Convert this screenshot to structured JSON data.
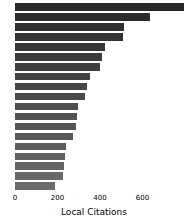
{
  "chart_data": {
    "type": "bar",
    "orientation": "horizontal",
    "title": "",
    "xlabel": "Local Citations",
    "ylabel": "",
    "xlim": [
      0,
      800
    ],
    "ylim": null,
    "grid": false,
    "legend": null,
    "xticks": [
      0,
      200,
      400,
      600
    ],
    "xtick_labels": [
      "0",
      "200",
      "400",
      "600"
    ],
    "ytick_labels": [],
    "bar_color": "#6b6b6b",
    "background_color": "#ffffff",
    "categories": [
      "1",
      "2",
      "3",
      "4",
      "5",
      "6",
      "7",
      "8",
      "9",
      "10",
      "11",
      "12",
      "13",
      "14",
      "15",
      "16",
      "17",
      "18",
      "19"
    ],
    "values": [
      795,
      635,
      515,
      510,
      425,
      410,
      400,
      355,
      340,
      330,
      295,
      290,
      285,
      275,
      240,
      235,
      230,
      225,
      190
    ]
  }
}
